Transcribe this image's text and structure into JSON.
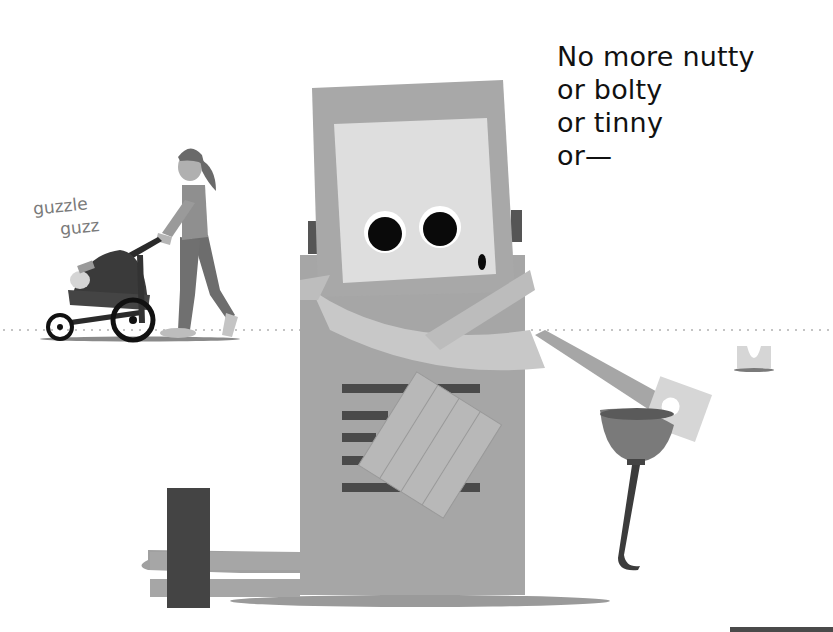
{
  "page": {
    "type": "picture-book-spread",
    "background": "#ffffff"
  },
  "verse": {
    "lines": [
      "No more nutty",
      "or bolty",
      "or tinny",
      "or—"
    ]
  },
  "sound_effect": {
    "line1": "guzzle",
    "line2": "guzz"
  },
  "illustration": {
    "characters": [
      "robot-with-scarf",
      "woman-pushing-stroller",
      "baby-in-stroller"
    ],
    "props": [
      "oil-funnel",
      "hammer-block",
      "small-u-bracket"
    ],
    "colors": {
      "robot_body": "#a6a6a6",
      "robot_face": "#dcdcdc",
      "scarf": "#c8c8c8",
      "dark_accent": "#4a4a4a",
      "eye": "#0a0a0a",
      "ground_dots": "#c4c4c4",
      "shadow": "#9a9a9a"
    }
  }
}
